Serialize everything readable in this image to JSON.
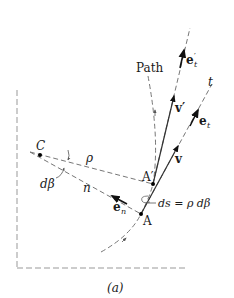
{
  "figure": {
    "caption": "(a)",
    "labels": {
      "path": "Path",
      "center": "C",
      "rho": "ρ",
      "dbeta": "dβ",
      "n": "n",
      "t": "t",
      "point_A": "A",
      "point_A_prime": "A′",
      "e_n": "e",
      "e_n_sub": "n",
      "e_t": "e",
      "e_t_sub": "t",
      "e_t_prime": "e",
      "e_t_prime_sub": "t",
      "e_t_prime_mark": "′",
      "v": "v",
      "v_prime": "v′",
      "ds_eq": "ds = ρ dβ"
    },
    "colors": {
      "line": "#333333",
      "dashed": "#777777",
      "frame": "#999999",
      "text": "#1a1a1a"
    }
  }
}
